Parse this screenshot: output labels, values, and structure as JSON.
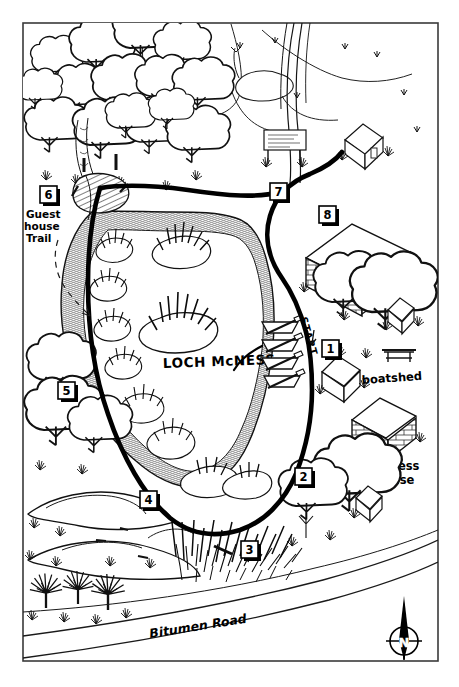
{
  "map": {
    "title": "Loch McNess walk map",
    "frame": {
      "x": 22,
      "y": 22,
      "width": 417,
      "height": 640,
      "stroke": "#3a3a3a",
      "fill": "#ffffff"
    },
    "colors": {
      "ink": "#000000",
      "line": "#111111",
      "trail": "#000000",
      "paper": "#ffffff",
      "road": "#1a1a1a",
      "hatch": "#222222"
    },
    "labels": {
      "lake": "LOCH McNESS",
      "guest_house_trail": "Guest House Trail",
      "yanchep_inn": "Yanchep Inn",
      "boatshed": "boatshed",
      "mcness_house_line1": "McNess",
      "mcness_house_line2": "House",
      "start": "START",
      "road": "Bitumen  Road",
      "compass": "N"
    },
    "markers": [
      {
        "id": "1",
        "label": "1",
        "x": 330,
        "y": 350
      },
      {
        "id": "2",
        "label": "2",
        "x": 303,
        "y": 478
      },
      {
        "id": "3",
        "label": "3",
        "x": 249,
        "y": 551
      },
      {
        "id": "4",
        "label": "4",
        "x": 148,
        "y": 501
      },
      {
        "id": "5",
        "label": "5",
        "x": 66,
        "y": 392
      },
      {
        "id": "6",
        "label": "6",
        "x": 48,
        "y": 196
      },
      {
        "id": "7",
        "label": "7",
        "x": 278,
        "y": 193
      },
      {
        "id": "8",
        "label": "8",
        "x": 327,
        "y": 216
      }
    ],
    "features": [
      {
        "name": "tree-grove-upper-left",
        "kind": "trees"
      },
      {
        "name": "pond-north-west",
        "kind": "water"
      },
      {
        "name": "pond-north-east",
        "kind": "water"
      },
      {
        "name": "boardwalk-bridge",
        "kind": "bridge"
      },
      {
        "name": "reed-island-north",
        "kind": "reeds"
      },
      {
        "name": "reed-island-central",
        "kind": "reeds"
      },
      {
        "name": "rowboats",
        "kind": "boats"
      },
      {
        "name": "picnic-table",
        "kind": "furniture"
      },
      {
        "name": "park-sign",
        "kind": "sign"
      },
      {
        "name": "limestone-outcrop",
        "kind": "rocks"
      },
      {
        "name": "grass-trees",
        "kind": "plants"
      },
      {
        "name": "reed-bed-south",
        "kind": "reeds"
      }
    ]
  }
}
